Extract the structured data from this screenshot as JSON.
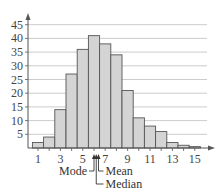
{
  "chart_data": {
    "type": "bar",
    "title": "",
    "xlabel": "",
    "ylabel": "",
    "x": [
      1,
      2,
      3,
      4,
      5,
      6,
      7,
      8,
      9,
      10,
      11,
      12,
      13,
      14,
      15
    ],
    "values": [
      2,
      4,
      14,
      27,
      36,
      41,
      38,
      34,
      21,
      11,
      8,
      6,
      2,
      1,
      0.5
    ],
    "ylim": [
      0,
      48
    ],
    "xlim": [
      0.3,
      16
    ],
    "yticks": [
      5,
      10,
      15,
      20,
      25,
      30,
      35,
      40,
      45
    ],
    "xticks": [
      1,
      3,
      5,
      7,
      9,
      11,
      13,
      15
    ],
    "xtick_labels": [
      "1",
      "3",
      "5",
      "7",
      "9",
      "11",
      "13",
      "15"
    ],
    "grid": true,
    "bar_color": "#d4d4d4",
    "bar_edge_color": "#555555",
    "annotations": [
      {
        "label": "Mode",
        "x": 6.0,
        "side": "left"
      },
      {
        "label": "Median",
        "x": 6.2,
        "side": "right"
      },
      {
        "label": "Mean",
        "x": 6.4,
        "side": "right"
      }
    ]
  }
}
